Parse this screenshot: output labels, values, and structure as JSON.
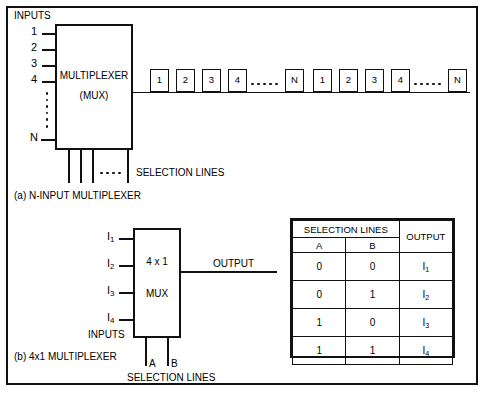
{
  "figure": {
    "section_a": {
      "inputs_label": "INPUTS",
      "input_labels": [
        "1",
        "2",
        "3",
        "4"
      ],
      "input_last_label": "N",
      "mux_title": "MULTIPLEXER",
      "mux_subtitle": "(MUX)",
      "selection_lines_label": "SELECTION LINES",
      "caption": "(a) N-INPUT MULTIPLEXER",
      "stream_group_1": [
        "1",
        "2",
        "3",
        "4"
      ],
      "stream_group_1_last": "N",
      "stream_group_2": [
        "1",
        "2",
        "3",
        "4"
      ],
      "stream_group_2_last": "N"
    },
    "section_b": {
      "input_labels": [
        "I",
        "I",
        "I",
        "I"
      ],
      "input_subscripts": [
        "1",
        "2",
        "3",
        "4"
      ],
      "inputs_label": "INPUTS",
      "mux_title": "4 x 1",
      "mux_subtitle": "MUX",
      "output_label": "OUTPUT",
      "selection_line_a": "A",
      "selection_line_b": "B",
      "selection_lines_label": "SELECTION LINES",
      "caption": "(b) 4x1 MULTIPLEXER"
    },
    "truth_table": {
      "header_group": "SELECTION LINES",
      "header_output": "OUTPUT",
      "col_a": "A",
      "col_b": "B",
      "rows": [
        {
          "a": "0",
          "b": "0",
          "out_base": "I",
          "out_sub": "1"
        },
        {
          "a": "0",
          "b": "1",
          "out_base": "I",
          "out_sub": "2"
        },
        {
          "a": "1",
          "b": "0",
          "out_base": "I",
          "out_sub": "3"
        },
        {
          "a": "1",
          "b": "1",
          "out_base": "I",
          "out_sub": "4"
        }
      ]
    }
  },
  "colors": {
    "ink": "#111111",
    "paper": "#ffffff"
  }
}
